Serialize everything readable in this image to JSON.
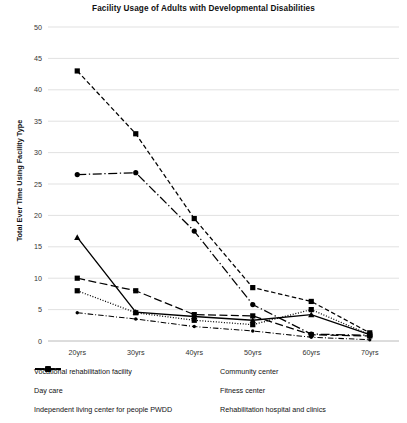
{
  "chart_data": {
    "type": "line",
    "title": "Facility Usage of Adults with Developmental Disabilities",
    "xlabel": "",
    "ylabel": "Total Ever Time Using Facility Type",
    "categories": [
      "20yrs",
      "30yrs",
      "40yrs",
      "50yrs",
      "60yrs",
      "70yrs"
    ],
    "ylim": [
      0,
      50
    ],
    "ytick_step": 5,
    "yticks": [
      0,
      5,
      10,
      15,
      20,
      25,
      30,
      35,
      40,
      45,
      50
    ],
    "grid": true,
    "legend_position": "bottom",
    "series": [
      {
        "name": "Vocational rehabilitation facility",
        "values": [
          4.5,
          3.5,
          2.3,
          1.6,
          0.6,
          0.2
        ],
        "style": "dash-dot",
        "marker": "dot"
      },
      {
        "name": "Community center",
        "values": [
          43,
          33,
          19.5,
          8.5,
          6.3,
          1.3
        ],
        "style": "dashed",
        "marker": "square"
      },
      {
        "name": "Day care",
        "values": [
          16.5,
          4.6,
          3.9,
          3.3,
          4.2,
          1.0
        ],
        "style": "solid",
        "marker": "triangle"
      },
      {
        "name": "Fitness center",
        "values": [
          10.0,
          8.0,
          4.2,
          4.0,
          1.0,
          0.8
        ],
        "style": "long-dash",
        "marker": "square"
      },
      {
        "name": "Independent living center for people PWDD",
        "values": [
          8.0,
          4.5,
          3.3,
          2.6,
          5.0,
          1.0
        ],
        "style": "dotted",
        "marker": "square"
      },
      {
        "name": "Rehabilitation hospital and clinics",
        "values": [
          26.5,
          26.8,
          17.5,
          5.8,
          1.1,
          0.9
        ],
        "style": "dash-dot-long",
        "marker": "circle"
      }
    ]
  }
}
